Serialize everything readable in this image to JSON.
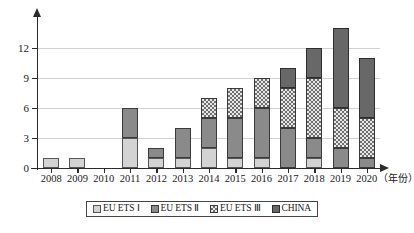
{
  "chart_data": {
    "type": "bar",
    "stacked": true,
    "title": "",
    "xlabel": "（年份）",
    "ylabel": "",
    "ylim": [
      0,
      15
    ],
    "yticks": [
      0,
      3,
      6,
      9,
      12
    ],
    "grid": true,
    "legend_position": "bottom",
    "categories": [
      "2008",
      "2009",
      "2010",
      "2011",
      "2012",
      "2013",
      "2014",
      "2015",
      "2016",
      "2017",
      "2018",
      "2019",
      "2020"
    ],
    "series": [
      {
        "name": "EU ETS Ⅰ",
        "color": "#d3d3d3",
        "pattern": "solid-light",
        "values": [
          1,
          1,
          0,
          3,
          1,
          1,
          2,
          1,
          1,
          0,
          1,
          0,
          0
        ]
      },
      {
        "name": "EU ETS Ⅱ",
        "color": "#8a8a8a",
        "pattern": "solid-medium",
        "values": [
          0,
          0,
          0,
          3,
          1,
          3,
          3,
          4,
          5,
          4,
          2,
          2,
          1
        ]
      },
      {
        "name": "EU ETS Ⅲ",
        "color": "#6f6f6f",
        "pattern": "checker",
        "values": [
          0,
          0,
          0,
          0,
          0,
          0,
          2,
          3,
          3,
          4,
          6,
          4,
          4
        ]
      },
      {
        "name": "CHINA",
        "color": "#686868",
        "pattern": "solid-dark",
        "values": [
          0,
          0,
          0,
          0,
          0,
          0,
          0,
          0,
          0,
          2,
          3,
          8,
          6
        ]
      }
    ],
    "totals": [
      1,
      1,
      0,
      6,
      2,
      4,
      7,
      8,
      9,
      10,
      12,
      14,
      11
    ]
  }
}
